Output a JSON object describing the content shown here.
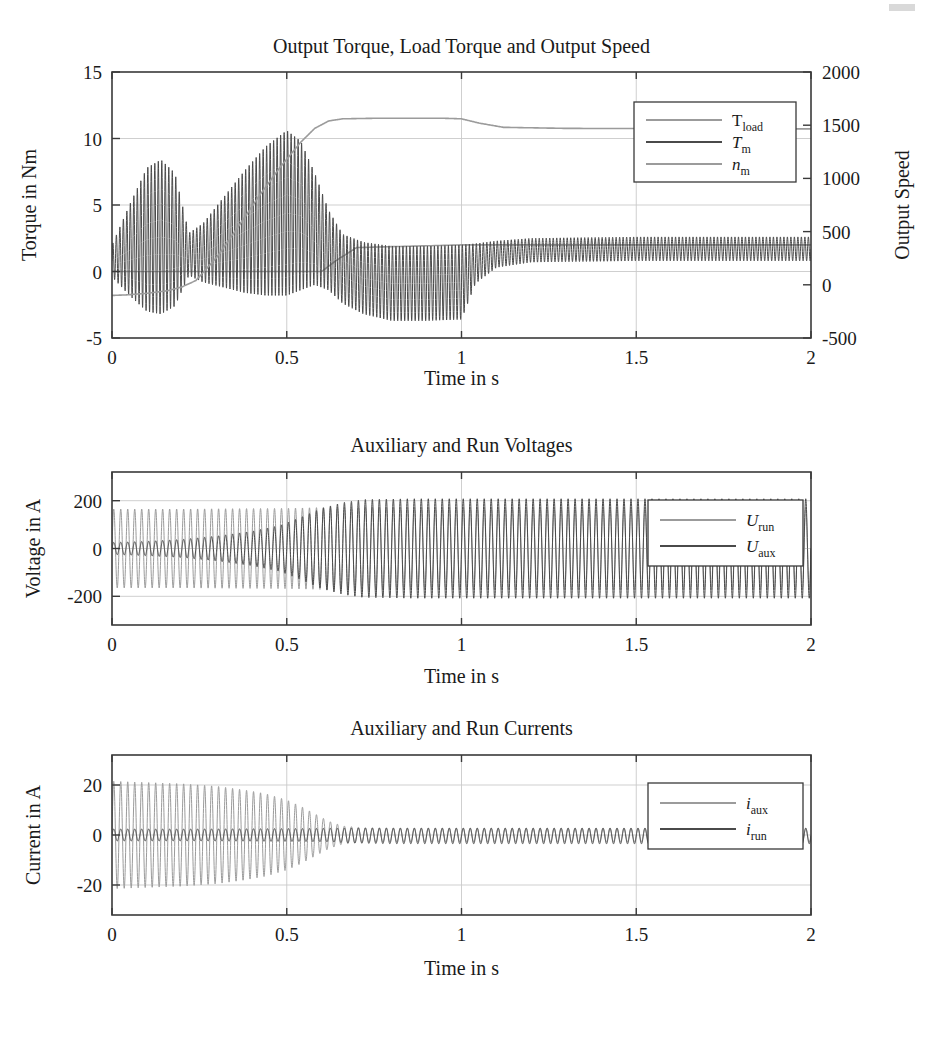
{
  "figure": {
    "width": 929,
    "height": 1037,
    "background": "#ffffff",
    "colors": {
      "light_gray": "#9b9b9b",
      "dark_gray": "#4a4a4a",
      "axis": "#3a3a3a",
      "grid": "#c9c9c9",
      "text": "#1a1a1a"
    }
  },
  "panels": [
    {
      "id": "torque-speed",
      "title": "Output Torque, Load Torque and Output Speed",
      "xlabel": "Time in s",
      "ylabel_left": "Torque in Nm",
      "ylabel_right": "Output Speed",
      "legend_position": "top-right",
      "legend": [
        {
          "label": "T",
          "sub": "load",
          "color": "#9b9b9b",
          "italic": false
        },
        {
          "label": "T",
          "sub": "m",
          "color": "#4a4a4a",
          "italic": true
        },
        {
          "label": "n",
          "sub": "m",
          "color": "#9b9b9b",
          "italic": true
        }
      ]
    },
    {
      "id": "voltages",
      "title": "Auxiliary and Run Voltages",
      "xlabel": "Time in s",
      "ylabel_left": "Voltage in A",
      "legend_position": "right",
      "legend": [
        {
          "label": "U",
          "sub": "run",
          "color": "#9b9b9b",
          "italic": true
        },
        {
          "label": "U",
          "sub": "aux",
          "color": "#4a4a4a",
          "italic": true
        }
      ]
    },
    {
      "id": "currents",
      "title": "Auxiliary and Run Currents",
      "xlabel": "Time in s",
      "ylabel_left": "Current in A",
      "legend_position": "right",
      "legend": [
        {
          "label": "i",
          "sub": "aux",
          "color": "#9b9b9b",
          "italic": true
        },
        {
          "label": "i",
          "sub": "run",
          "color": "#4a4a4a",
          "italic": true
        }
      ]
    }
  ],
  "chart_data": [
    {
      "type": "line",
      "id": "torque-speed",
      "title": "Output Torque, Load Torque and Output Speed",
      "xlabel": "Time in s",
      "ylabel": "Torque in Nm",
      "ylabel_right": "Output Speed",
      "xlim": [
        0,
        2
      ],
      "ylim": [
        -5,
        15
      ],
      "ylim_right": [
        -500,
        2000
      ],
      "xticks": [
        0,
        0.5,
        1,
        1.5,
        2
      ],
      "xticklabels": [
        "0",
        "0.5",
        "1",
        "1.5",
        "2"
      ],
      "yticks": [
        -5,
        0,
        5,
        10,
        15
      ],
      "yticklabels": [
        "-5",
        "0",
        "5",
        "10",
        "15"
      ],
      "yticks_right": [
        -500,
        0,
        500,
        1000,
        1500,
        2000
      ],
      "yticklabels_right": [
        "-500",
        "0",
        "500",
        "1000",
        "1500",
        "2000"
      ],
      "grid": true,
      "legend": [
        "T_load",
        "T_m",
        "n_m"
      ],
      "series": [
        {
          "name": "T_load",
          "axis": "left",
          "color": "#9b9b9b",
          "kind": "step",
          "description": "Load torque: 0 Nm until t=0.62 s, then ramps to 2 Nm and holds",
          "x": [
            0,
            0.6,
            0.64,
            0.7,
            1.0,
            2.0
          ],
          "y": [
            0,
            0,
            0.8,
            1.8,
            2.0,
            2.0
          ]
        },
        {
          "name": "T_m",
          "axis": "left",
          "color": "#4a4a4a",
          "kind": "oscillatory",
          "description": "Motor torque with 100 Hz ripple; envelope centre and half-amplitude below",
          "ripple_hz": 100,
          "envelope_x": [
            0.0,
            0.05,
            0.1,
            0.14,
            0.18,
            0.22,
            0.26,
            0.32,
            0.38,
            0.44,
            0.5,
            0.54,
            0.58,
            0.62,
            0.66,
            0.72,
            0.8,
            0.9,
            1.0,
            1.04,
            1.1,
            1.2,
            1.5,
            2.0
          ],
          "envelope_mid": [
            0.8,
            1.6,
            2.4,
            2.6,
            2.4,
            1.3,
            1.4,
            2.2,
            3.0,
            3.8,
            4.4,
            4.2,
            3.2,
            1.6,
            0.2,
            -0.5,
            -0.9,
            -0.9,
            -0.8,
            0.6,
            1.3,
            1.6,
            1.7,
            1.7
          ],
          "envelope_amp": [
            1.2,
            3.4,
            5.4,
            5.8,
            5.0,
            1.6,
            2.2,
            3.4,
            4.6,
            5.6,
            6.2,
            5.6,
            4.2,
            3.0,
            2.6,
            2.7,
            2.8,
            2.8,
            2.8,
            1.5,
            1.0,
            0.9,
            0.9,
            0.9
          ]
        },
        {
          "name": "n_m",
          "axis": "right",
          "color": "#9b9b9b",
          "kind": "smooth",
          "description": "Output speed rises from -100 rpm to ~1560 rpm by t=0.62 s, settles to ~1470 rpm",
          "x": [
            0.0,
            0.04,
            0.1,
            0.16,
            0.2,
            0.24,
            0.3,
            0.36,
            0.42,
            0.48,
            0.54,
            0.58,
            0.62,
            0.66,
            0.75,
            0.95,
            1.0,
            1.05,
            1.12,
            1.3,
            1.6,
            2.0
          ],
          "y": [
            -100,
            -95,
            -80,
            -55,
            -20,
            40,
            260,
            540,
            830,
            1100,
            1340,
            1470,
            1540,
            1560,
            1565,
            1565,
            1560,
            1520,
            1480,
            1470,
            1468,
            1465
          ]
        }
      ]
    },
    {
      "type": "line",
      "id": "voltages",
      "title": "Auxiliary and Run Voltages",
      "xlabel": "Time in s",
      "ylabel": "Voltage in A",
      "xlim": [
        0,
        2
      ],
      "ylim": [
        -320,
        320
      ],
      "xticks": [
        0,
        0.5,
        1,
        1.5,
        2
      ],
      "xticklabels": [
        "0",
        "0.5",
        "1",
        "1.5",
        "2"
      ],
      "yticks": [
        -200,
        0,
        200
      ],
      "yticklabels": [
        "-200",
        "0",
        "200"
      ],
      "grid": true,
      "legend": [
        "U_run",
        "U_aux"
      ],
      "series": [
        {
          "name": "U_run",
          "color": "#9b9b9b",
          "kind": "oscillatory",
          "description": "Run winding voltage, ~50 Hz, amplitude ~165 V roughly constant",
          "ripple_hz": 50,
          "envelope_x": [
            0.0,
            0.2,
            0.5,
            0.62,
            0.8,
            1.2,
            1.6,
            2.0
          ],
          "envelope_mid": [
            0,
            0,
            0,
            0,
            0,
            0,
            0,
            0
          ],
          "envelope_amp": [
            165,
            165,
            168,
            172,
            172,
            172,
            172,
            172
          ]
        },
        {
          "name": "U_aux",
          "color": "#4a4a4a",
          "kind": "oscillatory",
          "description": "Auxiliary winding voltage grows from ~25 V to ~210 V by t=0.7 s",
          "ripple_hz": 50,
          "envelope_x": [
            0.0,
            0.1,
            0.2,
            0.3,
            0.4,
            0.48,
            0.54,
            0.6,
            0.66,
            0.72,
            0.85,
            1.0,
            1.3,
            1.6,
            2.0
          ],
          "envelope_mid": [
            0,
            0,
            0,
            0,
            0,
            0,
            0,
            0,
            0,
            0,
            0,
            0,
            0,
            0,
            0
          ],
          "envelope_amp": [
            25,
            30,
            38,
            52,
            72,
            96,
            130,
            168,
            192,
            205,
            208,
            208,
            208,
            208,
            208
          ]
        }
      ]
    },
    {
      "type": "line",
      "id": "currents",
      "title": "Auxiliary and Run Currents",
      "xlabel": "Time in s",
      "ylabel": "Current in A",
      "xlim": [
        0,
        2
      ],
      "ylim": [
        -32,
        32
      ],
      "xticks": [
        0,
        0.5,
        1,
        1.5,
        2
      ],
      "xticklabels": [
        "0",
        "0.5",
        "1",
        "1.5",
        "2"
      ],
      "yticks": [
        -20,
        0,
        20
      ],
      "yticklabels": [
        "-20",
        "0",
        "20"
      ],
      "grid": true,
      "legend": [
        "i_aux",
        "i_run"
      ],
      "series": [
        {
          "name": "i_aux",
          "color": "#9b9b9b",
          "kind": "oscillatory",
          "description": "Auxiliary current ~21 A at start, decays to ~2 A after t=0.65 s",
          "ripple_hz": 50,
          "envelope_x": [
            0.0,
            0.1,
            0.2,
            0.3,
            0.38,
            0.44,
            0.5,
            0.54,
            0.58,
            0.62,
            0.66,
            0.72,
            0.85,
            1.0,
            1.4,
            2.0
          ],
          "envelope_mid": [
            0,
            0,
            0,
            0,
            0,
            0,
            0,
            0,
            0,
            0,
            0,
            0,
            0,
            0,
            0,
            0
          ],
          "envelope_amp": [
            21.5,
            21.0,
            20.5,
            19.5,
            18.0,
            16.5,
            14.0,
            11.5,
            8.5,
            5.5,
            3.6,
            2.9,
            2.8,
            2.8,
            2.8,
            2.8
          ]
        },
        {
          "name": "i_run",
          "color": "#4a4a4a",
          "kind": "oscillatory",
          "description": "Run current small, ~2.5 A ripple throughout, slight rise after t=0.65 s",
          "ripple_hz": 50,
          "envelope_x": [
            0.0,
            0.2,
            0.4,
            0.55,
            0.62,
            0.68,
            0.8,
            1.0,
            1.4,
            2.0
          ],
          "envelope_mid": [
            0,
            0,
            0,
            0,
            0,
            -0.2,
            -0.4,
            -0.4,
            -0.4,
            -0.4
          ],
          "envelope_amp": [
            2.4,
            2.4,
            2.5,
            2.6,
            2.7,
            3.0,
            3.1,
            3.1,
            3.1,
            3.1
          ]
        }
      ]
    }
  ]
}
